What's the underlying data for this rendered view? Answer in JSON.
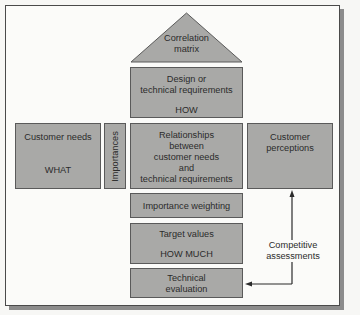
{
  "diagram": {
    "roof": {
      "lines": [
        "Correlation",
        "matrix"
      ]
    },
    "design": {
      "lines": [
        "Design or",
        "technical requirements"
      ],
      "tag": "HOW"
    },
    "customer_needs": {
      "line": "Customer needs",
      "tag": "WHAT"
    },
    "importances": {
      "label": "Importances"
    },
    "relationships": {
      "lines": [
        "Relationships",
        "between",
        "customer needs",
        "and",
        "technical requirements"
      ]
    },
    "customer_perceptions": {
      "lines": [
        "Customer",
        "perceptions"
      ]
    },
    "importance_weighting": {
      "label": "Importance weighting"
    },
    "target_values": {
      "line": "Target values",
      "tag": "HOW MUCH"
    },
    "technical_evaluation": {
      "lines": [
        "Technical",
        "evaluation"
      ]
    },
    "competitive_assessments": {
      "lines": [
        "Competitive",
        "assessments"
      ]
    }
  },
  "colors": {
    "box_fill": "#a9a9a7",
    "box_border": "#5a5a5a",
    "background": "#fbfbf9",
    "arrow": "#2b2b2b"
  }
}
